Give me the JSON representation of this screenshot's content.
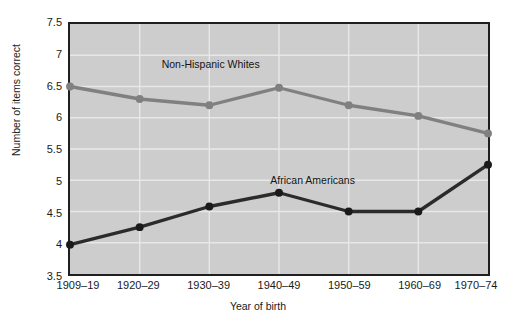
{
  "chart_data": {
    "type": "line",
    "title": "",
    "xlabel": "Year of birth",
    "ylabel": "Number of items correct",
    "categories": [
      "1909–19",
      "1920–29",
      "1930–39",
      "1940–49",
      "1950–59",
      "1960–69",
      "1970–74"
    ],
    "ylim": [
      3.5,
      7.5
    ],
    "yticks": [
      "3.5",
      "4",
      "4.5",
      "5",
      "5.5",
      "6",
      "6.5",
      "7",
      "7.5"
    ],
    "ytick_values": [
      3.5,
      4,
      4.5,
      5,
      5.5,
      6,
      6.5,
      7,
      7.5
    ],
    "grid": true,
    "grid_color": "#e8e8e8",
    "plot_background": "#cdcdcd",
    "legend": "inline-annotations",
    "series": [
      {
        "name": "Non-Hispanic Whites",
        "color": "#808080",
        "marker_color": "#808080",
        "values": [
          6.5,
          6.3,
          6.2,
          6.48,
          6.2,
          6.03,
          5.75
        ],
        "annotation": "Non-Hispanic Whites",
        "annotation_category_index": 2,
        "annotation_value": 6.85
      },
      {
        "name": "African Americans",
        "color": "#2b2b2b",
        "marker_color": "#1a1a1a",
        "values": [
          3.97,
          4.25,
          4.58,
          4.8,
          4.5,
          4.5,
          5.25
        ],
        "annotation": "African Americans",
        "annotation_category_index": 3.45,
        "annotation_value": 5.02
      }
    ]
  }
}
